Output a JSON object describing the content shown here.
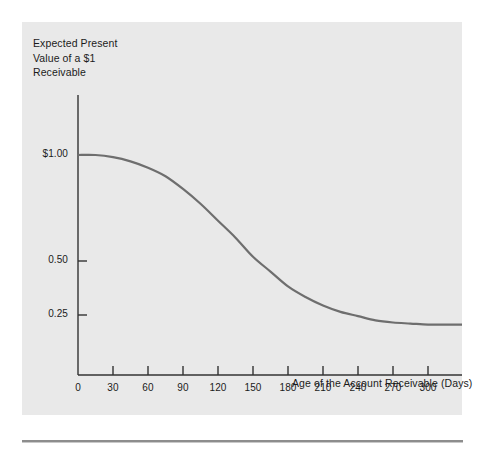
{
  "figure": {
    "panel_background": "#e9e9e9",
    "page_background": "#ffffff",
    "curve_color": "#6e6e6e",
    "axis_color": "#333333",
    "text_color": "#1b1b1b",
    "y_axis_title": "Expected Present\nValue of a $1\nReceivable",
    "x_axis_title": "Age of the Account Receivable (Days)"
  },
  "chart_data": {
    "type": "line",
    "title": "",
    "subtitle": "",
    "xlabel": "Age of the Account Receivable (Days)",
    "ylabel": "Expected Present Value of a $1 Receivable",
    "xlim": [
      0,
      330
    ],
    "ylim": [
      0,
      1.12
    ],
    "grid": false,
    "legend": null,
    "xticks": [
      0,
      30,
      60,
      90,
      120,
      150,
      180,
      210,
      240,
      270,
      300
    ],
    "xticklabels": [
      "0",
      "30",
      "60",
      "90",
      "120",
      "150",
      "180",
      "210",
      "240",
      "270",
      "300"
    ],
    "yticks": [
      0.25,
      0.5,
      1.0
    ],
    "yticklabels": [
      "0.25",
      "0.50",
      "$1.00"
    ],
    "series": [
      {
        "name": "Expected present value of a $1 receivable",
        "x": [
          0,
          15,
          30,
          45,
          60,
          75,
          90,
          105,
          120,
          135,
          150,
          165,
          180,
          195,
          210,
          225,
          240,
          255,
          270,
          285,
          300,
          315,
          330
        ],
        "values": [
          1.0,
          1.0,
          0.99,
          0.97,
          0.94,
          0.9,
          0.84,
          0.77,
          0.69,
          0.61,
          0.52,
          0.45,
          0.38,
          0.33,
          0.29,
          0.26,
          0.24,
          0.22,
          0.21,
          0.205,
          0.2,
          0.2,
          0.2
        ]
      }
    ],
    "annotations": []
  }
}
